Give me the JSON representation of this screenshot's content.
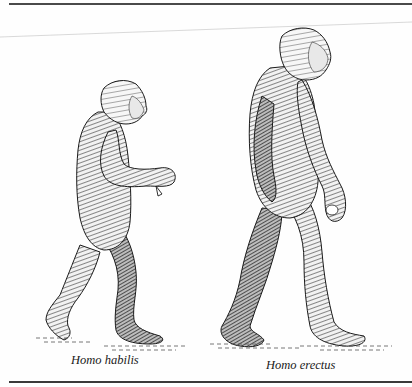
{
  "figure": {
    "specimens": [
      {
        "id": "habilis",
        "caption": "Homo habilis",
        "relative_height": "shorter"
      },
      {
        "id": "erectus",
        "caption": "Homo erectus",
        "relative_height": "taller"
      }
    ]
  },
  "colors": {
    "ink": "#1a1a1a",
    "rule": "#4a4a4a",
    "paper": "#fefefe"
  }
}
